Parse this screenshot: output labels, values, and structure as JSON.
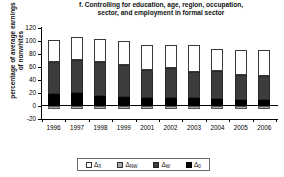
{
  "chart_data": {
    "type": "bar",
    "stacked": true,
    "title": "f. Controlling for education, age, region, occupation, sector, and employment in formal sector",
    "title_lines": [
      "f. Controlling for education, age, region, occupation,",
      "sector, and employment in formal sector"
    ],
    "xlabel": "",
    "ylabel": "percentage of average earnings of nonwhites",
    "ylabel_lines": [
      "percentage of average earnings",
      "of nonwhites"
    ],
    "ylim": [
      -20,
      120
    ],
    "yticks": [
      120,
      100,
      80,
      60,
      40,
      20,
      0,
      -20
    ],
    "ytick_labels": [
      "120",
      "100",
      "80",
      "60",
      "40",
      "20",
      "0",
      "-20"
    ],
    "grid": false,
    "legend_position": "bottom",
    "categories": [
      "1996",
      "1997",
      "1998",
      "1999",
      "2001",
      "2002",
      "2003",
      "2004",
      "2005",
      "2006"
    ],
    "series": [
      {
        "name": "Δ_0",
        "label": "Δ",
        "subscript": "0",
        "color": "#000000",
        "stack_order": 1,
        "values": [
          18,
          19,
          15,
          13,
          12,
          11,
          11,
          10,
          9,
          9
        ]
      },
      {
        "name": "Δ_W",
        "label": "Δ",
        "subscript": "W",
        "color": "#3c3c3c",
        "stack_order": 2,
        "values": [
          49,
          51,
          52,
          50,
          43,
          46,
          41,
          43,
          38,
          37
        ]
      },
      {
        "name": "Δ_X",
        "label": "Δ",
        "subscript": "X",
        "color": "#ffffff",
        "stack_order": 3,
        "values": [
          34,
          35,
          35,
          36,
          38,
          36,
          41,
          34,
          39,
          40
        ]
      },
      {
        "name": "Δ_NW",
        "label": "Δ",
        "subscript": "NW",
        "color": "#a8a8a8",
        "stack_order": 0,
        "values": [
          -5,
          -5,
          -5,
          -5,
          -5,
          -5,
          -5,
          -5,
          -5,
          -5
        ]
      }
    ],
    "totals": [
      101,
      105,
      102,
      99,
      93,
      93,
      93,
      87,
      86,
      86
    ]
  },
  "legend": {
    "items": [
      {
        "key": "x",
        "label": "Δ",
        "subscript": "X",
        "color": "#ffffff"
      },
      {
        "key": "nw",
        "label": "Δ",
        "subscript": "NW",
        "color": "#a8a8a8"
      },
      {
        "key": "w",
        "label": "Δ",
        "subscript": "W",
        "color": "#3c3c3c"
      },
      {
        "key": "0",
        "label": "Δ",
        "subscript": "0",
        "color": "#000000"
      }
    ]
  }
}
